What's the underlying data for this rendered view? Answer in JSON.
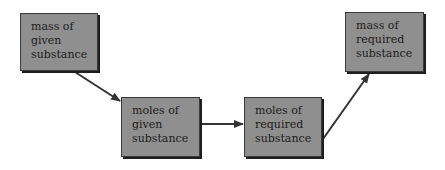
{
  "diagram": {
    "type": "flowchart",
    "nodes": [
      {
        "id": "mass-given",
        "lines": [
          "mass of",
          "given",
          "substance"
        ]
      },
      {
        "id": "moles-given",
        "lines": [
          "moles of",
          "given",
          "substance"
        ]
      },
      {
        "id": "moles-required",
        "lines": [
          "moles of",
          "required",
          "substance"
        ]
      },
      {
        "id": "mass-required",
        "lines": [
          "mass of",
          "required",
          "substance"
        ]
      }
    ],
    "edges": [
      {
        "from": "mass-given",
        "to": "moles-given"
      },
      {
        "from": "moles-given",
        "to": "moles-required"
      },
      {
        "from": "moles-required",
        "to": "mass-required"
      }
    ],
    "colors": {
      "node_fill": "#8f8f8f",
      "node_border": "#3a3a3a",
      "arrow": "#333333",
      "text": "#1c1c1c"
    }
  }
}
